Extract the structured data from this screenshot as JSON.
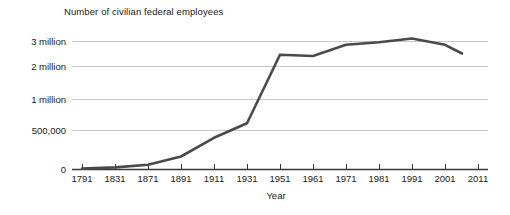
{
  "chart_data": {
    "type": "line",
    "title": "Number of civilian federal employees",
    "xlabel": "Year",
    "ylabel": "",
    "categories": [
      "1791",
      "1831",
      "1871",
      "1891",
      "1911",
      "1931",
      "1951",
      "1961",
      "1971",
      "1981",
      "1991",
      "2001",
      "2011"
    ],
    "values": [
      5000,
      20000,
      55000,
      160000,
      400000,
      610000,
      2450000,
      2400000,
      2850000,
      2950000,
      3100000,
      2850000,
      2500000
    ],
    "y_tick_labels": [
      "0",
      "500,000",
      "1 million",
      "2 million",
      "3 million"
    ],
    "y_tick_values": [
      0,
      500000,
      1000000,
      2000000,
      3000000
    ],
    "y_scale": "broken-nonlinear",
    "grid": true,
    "legend": "none",
    "line_color": "#4a4a4a",
    "axis_color": "#3a3a3a",
    "grid_color": "#c9c9c9",
    "background_color": "#ffffff"
  }
}
